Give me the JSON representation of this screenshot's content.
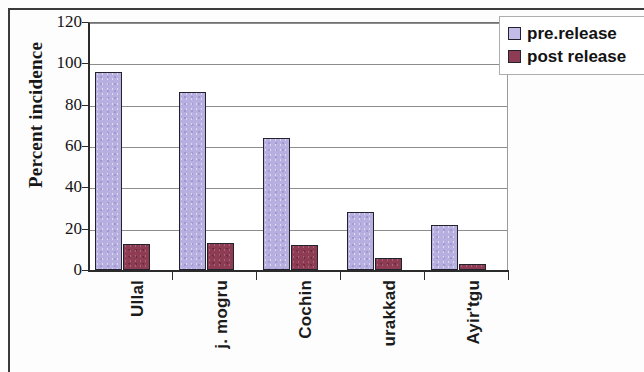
{
  "chart_data": {
    "type": "bar",
    "title": "",
    "xlabel": "",
    "ylabel": "Percent incidence",
    "ylim": [
      0,
      120
    ],
    "yticks": [
      "0",
      "20",
      "40",
      "60",
      "80",
      "100",
      "120"
    ],
    "grid": true,
    "legend_position": "top-right",
    "categories": [
      "Ullal",
      "j. mogru",
      "Cochin",
      "urakkad",
      "Ayir'tgu"
    ],
    "series": [
      {
        "name": "pre.release",
        "color": "#b6afdf",
        "values": [
          96,
          86,
          64,
          28,
          22
        ]
      },
      {
        "name": "post release",
        "color": "#8e3b54",
        "values": [
          12.5,
          13,
          12,
          6,
          3
        ]
      }
    ]
  },
  "legend": {
    "items": [
      {
        "label": "pre.release"
      },
      {
        "label": "post release"
      }
    ]
  }
}
